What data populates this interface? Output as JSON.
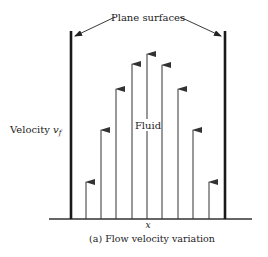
{
  "labels": {
    "plane_surfaces": "Plane surfaces",
    "fluid": "Fluid",
    "velocity": "Velocity ",
    "velocity_symbol": "v",
    "velocity_subscript": "f",
    "x_axis": "x",
    "caption": "(a) Flow velocity variation"
  },
  "colors": {
    "wall": "#1a1a1a",
    "arrow": "#333333",
    "text": "#222222"
  },
  "geometry": {
    "baseline_y": 219,
    "baseline_x": [
      49,
      252
    ],
    "walls": [
      {
        "x": 71,
        "top": 31
      },
      {
        "x": 225,
        "top": 31
      }
    ],
    "arrows": [
      {
        "x": 86,
        "tip": 182
      },
      {
        "x": 101,
        "tip": 130
      },
      {
        "x": 116,
        "tip": 89
      },
      {
        "x": 132,
        "tip": 64
      },
      {
        "x": 147,
        "tip": 54
      },
      {
        "x": 162,
        "tip": 65
      },
      {
        "x": 178,
        "tip": 89
      },
      {
        "x": 193,
        "tip": 130
      },
      {
        "x": 209,
        "tip": 182
      }
    ]
  }
}
